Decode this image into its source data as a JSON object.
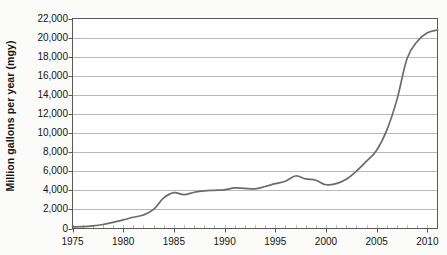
{
  "chart_data": {
    "type": "line",
    "title": "",
    "xlabel": "",
    "ylabel": "Million gallons per year (mgy)",
    "xlim": [
      1975,
      2011
    ],
    "ylim": [
      0,
      22000
    ],
    "grid": true,
    "legend": false,
    "y_ticks": [
      0,
      2000,
      4000,
      6000,
      8000,
      10000,
      12000,
      14000,
      16000,
      18000,
      20000,
      22000
    ],
    "y_tick_labels": [
      "0",
      "2,000",
      "4,000",
      "6,000",
      "8,000",
      "10,000",
      "12,000",
      "14,000",
      "16,000",
      "18,000",
      "20,000",
      "22,000"
    ],
    "x_ticks": [
      1975,
      1980,
      1985,
      1990,
      1995,
      2000,
      2005,
      2010
    ],
    "x_tick_labels": [
      "1975",
      "1980",
      "1985",
      "1990",
      "1995",
      "2000",
      "2005",
      "2010"
    ],
    "x_minor_tick_interval": 1,
    "line_color": "#6b6b6b",
    "grid_color": "#b9b9b9",
    "axis_color": "#595959",
    "plot_background": "#ffffff",
    "figure_background": "#fbfbfa",
    "series": [
      {
        "name": "Million gallons per year",
        "x": [
          1975,
          1976,
          1977,
          1978,
          1979,
          1980,
          1981,
          1982,
          1983,
          1984,
          1985,
          1986,
          1987,
          1988,
          1989,
          1990,
          1991,
          1992,
          1993,
          1994,
          1995,
          1996,
          1997,
          1998,
          1999,
          2000,
          2001,
          2002,
          2003,
          2004,
          2005,
          2006,
          2007,
          2008,
          2009,
          2010,
          2011
        ],
        "values": [
          175,
          200,
          280,
          420,
          640,
          900,
          1180,
          1420,
          2000,
          3200,
          3750,
          3550,
          3800,
          3950,
          4000,
          4050,
          4250,
          4200,
          4150,
          4400,
          4700,
          4950,
          5500,
          5200,
          5050,
          4580,
          4700,
          5150,
          6000,
          7050,
          8200,
          10300,
          13500,
          17800,
          19600,
          20500,
          20800
        ]
      }
    ]
  }
}
